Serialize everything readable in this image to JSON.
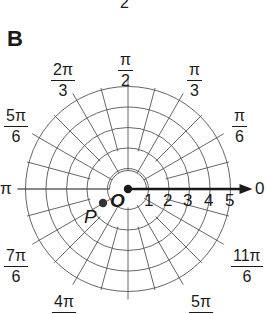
{
  "figure": {
    "panel_letter": "B",
    "top_cropped_text": "2"
  },
  "grid": {
    "center": {
      "x": 128,
      "y": 189
    },
    "unit_px": 20.5,
    "circles": [
      1,
      2,
      3,
      4,
      5
    ],
    "radial_step_deg": 15,
    "line_color": "#555555",
    "axis_color": "#1a1a1a"
  },
  "polar_axis": {
    "angle_label": "0",
    "radius_labels": [
      "1",
      "2",
      "3",
      "4",
      "5"
    ]
  },
  "angle_labels": [
    {
      "key": "pi_over_2",
      "num": "π",
      "den": "2"
    },
    {
      "key": "pi_over_3",
      "num": "π",
      "den": "3"
    },
    {
      "key": "two_pi_over_3",
      "num": "2π",
      "den": "3"
    },
    {
      "key": "pi_over_6",
      "num": "π",
      "den": "6"
    },
    {
      "key": "five_pi_over_6",
      "num": "5π",
      "den": "6"
    },
    {
      "key": "pi",
      "text": "π"
    },
    {
      "key": "zero",
      "text": "0"
    },
    {
      "key": "seven_pi_over_6",
      "num": "7π",
      "den": "6"
    },
    {
      "key": "eleven_pi_over_6",
      "num": "11π",
      "den": "6"
    },
    {
      "key": "four_pi_over_3_partial",
      "num": "4π"
    },
    {
      "key": "five_pi_over_3_partial",
      "num": "5π"
    }
  ],
  "points": {
    "origin": {
      "label": "O"
    },
    "p": {
      "label": "P"
    }
  }
}
